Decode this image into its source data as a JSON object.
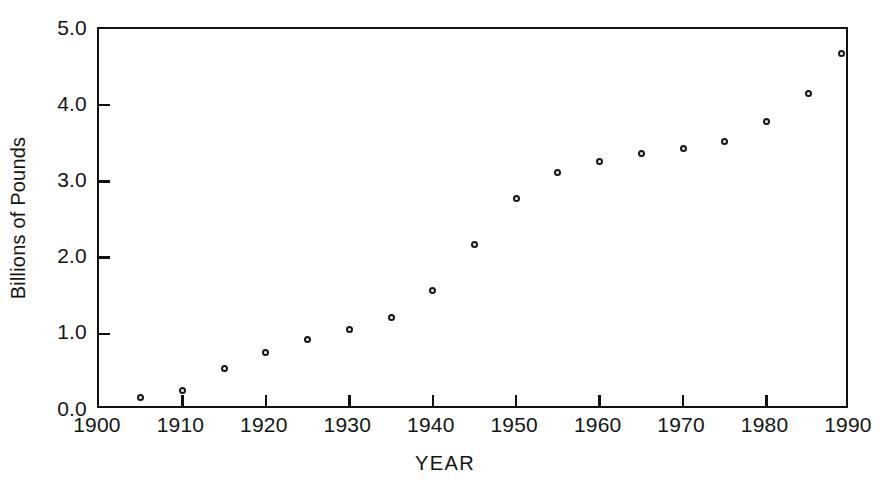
{
  "chart_data": {
    "type": "scatter",
    "title": "",
    "subtitle": "",
    "xlabel": "YEAR",
    "ylabel": "Billions of Pounds",
    "xlim": [
      1900,
      1990
    ],
    "ylim": [
      0.0,
      5.0
    ],
    "grid": false,
    "legend": null,
    "marker_style": "open-circle",
    "marker_color": "#15161a",
    "xticks": [
      1900,
      1910,
      1920,
      1930,
      1940,
      1950,
      1960,
      1970,
      1980,
      1990
    ],
    "xticklabels": [
      "1900",
      "1910",
      "1920",
      "1930",
      "1940",
      "1950",
      "1960",
      "1970",
      "1980",
      "1990"
    ],
    "yticks": [
      0.0,
      1.0,
      2.0,
      3.0,
      4.0,
      5.0
    ],
    "yticklabels": [
      "0.0",
      "1.0",
      "2.0",
      "3.0",
      "4.0",
      "5.0"
    ],
    "x": [
      1905,
      1910,
      1915,
      1920,
      1925,
      1930,
      1935,
      1940,
      1945,
      1950,
      1955,
      1960,
      1965,
      1970,
      1975,
      1980,
      1985,
      1989
    ],
    "values": [
      0.17,
      0.25,
      0.55,
      0.76,
      0.92,
      1.06,
      1.21,
      1.57,
      2.17,
      2.77,
      3.12,
      3.26,
      3.37,
      3.43,
      3.52,
      3.79,
      4.16,
      4.68
    ],
    "points": [
      {
        "x": 1905,
        "y": 0.17
      },
      {
        "x": 1910,
        "y": 0.25
      },
      {
        "x": 1915,
        "y": 0.55
      },
      {
        "x": 1920,
        "y": 0.76
      },
      {
        "x": 1925,
        "y": 0.92
      },
      {
        "x": 1930,
        "y": 1.06
      },
      {
        "x": 1935,
        "y": 1.21
      },
      {
        "x": 1940,
        "y": 1.57
      },
      {
        "x": 1945,
        "y": 2.17
      },
      {
        "x": 1950,
        "y": 2.77
      },
      {
        "x": 1955,
        "y": 3.12
      },
      {
        "x": 1960,
        "y": 3.26
      },
      {
        "x": 1965,
        "y": 3.37
      },
      {
        "x": 1970,
        "y": 3.43
      },
      {
        "x": 1975,
        "y": 3.52
      },
      {
        "x": 1980,
        "y": 3.79
      },
      {
        "x": 1985,
        "y": 4.16
      },
      {
        "x": 1989,
        "y": 4.68
      }
    ]
  }
}
